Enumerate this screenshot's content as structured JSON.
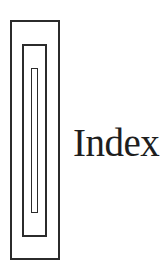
{
  "icon": {
    "name": "nested-rectangles-icon",
    "stroke_color": "#2b2b2b"
  },
  "label": {
    "text": "Index",
    "color": "#1e1e1e"
  }
}
